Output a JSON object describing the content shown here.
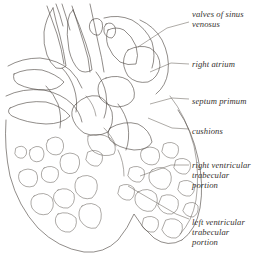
{
  "figure": {
    "kind": "anatomical-line-drawing",
    "background_color": "#ffffff",
    "ink_color": "#4c4641",
    "stipple_color": "#9a938b",
    "leader_color": "#6b645d",
    "text_color": "#35312e"
  },
  "labels": [
    {
      "id": "valves-of-sinus-venosus",
      "text": "valves of sinus\nvenosus",
      "x": 192,
      "y": 9,
      "leader": "M 189 22 L 167 28 L 138 47"
    },
    {
      "id": "right-atrium",
      "text": "right atrium",
      "x": 192,
      "y": 59,
      "leader": "M 189 64 L 171 63 L 150 72"
    },
    {
      "id": "septum-primum",
      "text": "septum primum",
      "x": 192,
      "y": 96,
      "leader": "M 189 99 L 172 98 L 150 104"
    },
    {
      "id": "cushions",
      "text": "cushions",
      "x": 192,
      "y": 126,
      "leader": "M 189 129 L 172 128 L 148 118"
    },
    {
      "id": "right-ventricular-trabecular-portion",
      "text": "right ventricular\ntrabecular\nportion",
      "x": 192,
      "y": 160,
      "leader": "M 189 165 L 171 165 L 140 176"
    },
    {
      "id": "left-ventricular-trabecular-portion",
      "text": "left ventricular\ntrabecular\nportion",
      "x": 192,
      "y": 217,
      "leader": "M 189 219 L 176 214 L 128 186"
    }
  ]
}
